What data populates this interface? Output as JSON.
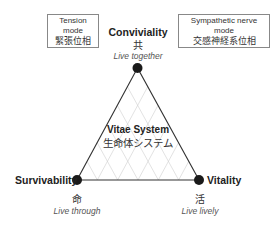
{
  "modes": {
    "tension": {
      "en": "Tension mode",
      "jp": "緊張位相"
    },
    "sympathetic": {
      "en": "Sympathetic nerve mode",
      "jp": "交感神経系位相"
    }
  },
  "center": {
    "en": "Vitae System",
    "jp": "生命体システム"
  },
  "vertices": {
    "top": {
      "en": "Conviviality",
      "kanji": "共",
      "sub": "Live together"
    },
    "left": {
      "en": "Survivability",
      "kanji": "命",
      "sub": "Live through"
    },
    "right": {
      "en": "Vitality",
      "kanji": "活",
      "sub": "Live lively"
    }
  },
  "colors": {
    "line": "#333333",
    "grid": "#c8c8c8",
    "dot": "#1a1a1a"
  }
}
